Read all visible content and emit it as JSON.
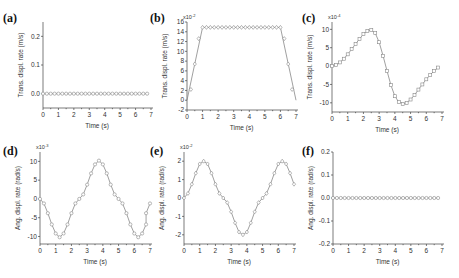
{
  "chart_data": [
    {
      "id": "a",
      "panel_label": "(a)",
      "type": "line",
      "marker": "circle",
      "xlabel": "Time (s)",
      "ylabel": "Trans. displ. rate (m/s)",
      "multiplier": "",
      "xlim": [
        0,
        7
      ],
      "ylim": [
        -0.05,
        0.25
      ],
      "xticks": [
        "0",
        "1",
        "2",
        "3",
        "4",
        "5",
        "6",
        "7"
      ],
      "yticks": [
        "0.0",
        "0.1",
        "0.2"
      ],
      "ytick_values": [
        0.0,
        0.1,
        0.2
      ],
      "x": [
        0,
        0.25,
        0.5,
        0.75,
        1,
        1.25,
        1.5,
        1.75,
        2,
        2.25,
        2.5,
        2.75,
        3,
        3.25,
        3.5,
        3.75,
        4,
        4.25,
        4.5,
        4.75,
        5,
        5.25,
        5.5,
        5.75,
        6,
        6.25,
        6.5,
        6.75
      ],
      "y": [
        0,
        0,
        0,
        0,
        0,
        0,
        0,
        0,
        0,
        0,
        0,
        0,
        0,
        0,
        0,
        0,
        0,
        0,
        0,
        0,
        0,
        0,
        0,
        0,
        0,
        0,
        0,
        0
      ]
    },
    {
      "id": "b",
      "panel_label": "(b)",
      "type": "line",
      "marker": "diamond",
      "xlabel": "Time (s)",
      "ylabel": "Trans. displ. rate (m/s)",
      "multiplier": "x10",
      "multiplier_exp": "-2",
      "xlim": [
        0,
        7
      ],
      "ylim": [
        -2,
        16
      ],
      "xticks": [
        "0",
        "1",
        "2",
        "3",
        "4",
        "5",
        "6",
        "7"
      ],
      "yticks": [
        "-2",
        "0",
        "2",
        "4",
        "6",
        "8",
        "10",
        "12",
        "14",
        "16"
      ],
      "ytick_values": [
        -2,
        0,
        2,
        4,
        6,
        8,
        10,
        12,
        14,
        16
      ],
      "x": [
        0.25,
        0.5,
        0.75,
        1,
        1.25,
        1.5,
        1.75,
        2,
        2.25,
        2.5,
        2.75,
        3,
        3.25,
        3.5,
        3.75,
        4,
        4.25,
        4.5,
        4.75,
        5,
        5.25,
        5.5,
        5.75,
        6,
        6.25,
        6.5,
        6.75
      ],
      "y": [
        2.2,
        7.4,
        12.6,
        14.9,
        14.9,
        14.9,
        14.9,
        14.9,
        14.9,
        14.9,
        14.9,
        14.9,
        14.9,
        14.9,
        14.9,
        14.9,
        14.9,
        14.9,
        14.9,
        14.9,
        14.9,
        14.9,
        14.9,
        14.9,
        12.6,
        7.4,
        2.2
      ],
      "line_x": [
        0,
        1,
        6,
        7
      ],
      "line_y": [
        0,
        14.9,
        14.9,
        0
      ]
    },
    {
      "id": "c",
      "panel_label": "(c)",
      "type": "line",
      "marker": "square",
      "xlabel": "Time (s)",
      "ylabel": "Trans. displ. rate (m/s)",
      "multiplier": "x10",
      "multiplier_exp": "-4",
      "xlim": [
        0,
        7
      ],
      "ylim": [
        -12.5,
        12
      ],
      "xticks": [
        "0",
        "1",
        "2",
        "3",
        "4",
        "5",
        "6",
        "7"
      ],
      "yticks": [
        "-10",
        "-5",
        "0",
        "5",
        "10"
      ],
      "ytick_values": [
        -10,
        -5,
        0,
        5,
        10
      ],
      "x": [
        0,
        0.25,
        0.5,
        0.75,
        1,
        1.25,
        1.5,
        1.75,
        2,
        2.25,
        2.5,
        2.75,
        3,
        3.25,
        3.5,
        3.75,
        4,
        4.25,
        4.5,
        4.75,
        5,
        5.25,
        5.5,
        5.75,
        6,
        6.25,
        6.5,
        6.75
      ],
      "y": [
        0,
        0.3,
        1,
        2,
        3.2,
        4.6,
        6,
        7.4,
        8.7,
        9.5,
        9.8,
        9,
        6.5,
        2.8,
        -1.3,
        -5.2,
        -8.2,
        -9.8,
        -10.3,
        -10,
        -9.1,
        -7.9,
        -6.4,
        -5,
        -3.6,
        -2.4,
        -1.3,
        -0.4
      ]
    },
    {
      "id": "d",
      "panel_label": "(d)",
      "type": "line",
      "marker": "circle",
      "xlabel": "Time (s)",
      "ylabel": "Ang. displ. rate (rad/s)",
      "multiplier": "x10",
      "multiplier_exp": "-3",
      "xlim": [
        0,
        7
      ],
      "ylim": [
        -12,
        12.5
      ],
      "xticks": [
        "0",
        "1",
        "2",
        "3",
        "4",
        "5",
        "6",
        "7"
      ],
      "yticks": [
        "-10",
        "-5",
        "0",
        "5",
        "10"
      ],
      "ytick_values": [
        -10,
        -5,
        0,
        5,
        10
      ],
      "x": [
        0,
        0.25,
        0.5,
        0.75,
        1,
        1.25,
        1.5,
        1.75,
        2,
        2.25,
        2.5,
        2.75,
        3,
        3.25,
        3.5,
        3.75,
        4,
        4.25,
        4.5,
        4.75,
        5,
        5.25,
        5.5,
        5.75,
        6,
        6.25,
        6.5,
        6.75
      ],
      "y": [
        0,
        -1.2,
        -3.8,
        -6.8,
        -9.2,
        -10.2,
        -9.2,
        -6.8,
        -3.8,
        -1.2,
        0,
        1.2,
        3.8,
        6.8,
        9.2,
        10.2,
        9.2,
        6.8,
        3.8,
        1.2,
        0,
        -1.2,
        -3.8,
        -6.8,
        -9.2,
        -10.2,
        -9.2,
        -6.8
      ],
      "tail_x": [
        6.5,
        6.75,
        7
      ],
      "tail_y": [
        -6.8,
        -3.8,
        -1.2
      ]
    },
    {
      "id": "e",
      "panel_label": "(e)",
      "type": "line",
      "marker": "diamond",
      "xlabel": "Time (s)",
      "ylabel": "Ang. displ. rate (rad/s)",
      "multiplier": "x10",
      "multiplier_exp": "-2",
      "xlim": [
        0,
        7
      ],
      "ylim": [
        -2.5,
        2.5
      ],
      "xticks": [
        "0",
        "1",
        "2",
        "3",
        "4",
        "5",
        "6",
        "7"
      ],
      "yticks": [
        "-2",
        "-1",
        "0",
        "1",
        "2"
      ],
      "ytick_values": [
        -2,
        -1,
        0,
        1,
        2
      ],
      "x": [
        0,
        0.25,
        0.5,
        0.75,
        1,
        1.25,
        1.5,
        1.75,
        2,
        2.25,
        2.5,
        2.75,
        3,
        3.25,
        3.5,
        3.75,
        4,
        4.25,
        4.5,
        4.75,
        5,
        5.25,
        5.5,
        5.75,
        6,
        6.25,
        6.5,
        6.75,
        7
      ],
      "y": [
        0,
        0.25,
        0.75,
        1.35,
        1.85,
        2.0,
        1.85,
        1.35,
        0.75,
        0.25,
        0,
        -0.25,
        -0.75,
        -1.35,
        -1.85,
        -2.0,
        -1.85,
        -1.35,
        -0.75,
        -0.25,
        0,
        0.25,
        0.75,
        1.35,
        1.85,
        2.0,
        1.85,
        1.35,
        0.75,
        0.1
      ]
    },
    {
      "id": "f",
      "panel_label": "(f)",
      "type": "line",
      "marker": "circle",
      "xlabel": "Time (s)",
      "ylabel": "Ang. displ. rate (rad/s)",
      "multiplier": "",
      "xlim": [
        0,
        7
      ],
      "ylim": [
        -0.2,
        0.2
      ],
      "xticks": [
        "0",
        "1",
        "2",
        "3",
        "4",
        "5",
        "6",
        "7"
      ],
      "yticks": [
        "-0.2",
        "-0.1",
        "0.0",
        "0.1",
        "0.2"
      ],
      "ytick_values": [
        -0.2,
        -0.1,
        0.0,
        0.1,
        0.2
      ],
      "x": [
        0,
        0.25,
        0.5,
        0.75,
        1,
        1.25,
        1.5,
        1.75,
        2,
        2.25,
        2.5,
        2.75,
        3,
        3.25,
        3.5,
        3.75,
        4,
        4.25,
        4.5,
        4.75,
        5,
        5.25,
        5.5,
        5.75,
        6,
        6.25,
        6.5,
        6.75
      ],
      "y": [
        0,
        0,
        0,
        0,
        0,
        0,
        0,
        0,
        0,
        0,
        0,
        0,
        0,
        0,
        0,
        0,
        0,
        0,
        0,
        0,
        0,
        0,
        0,
        0,
        0,
        0,
        0,
        0
      ]
    }
  ],
  "layout": {
    "panels": {
      "a": {
        "x0": 43,
        "x1": 151,
        "yTop": 22,
        "yBot": 108,
        "labelX": 3,
        "labelY": 22
      },
      "b": {
        "x0": 187,
        "x1": 296,
        "yTop": 22,
        "yBot": 110,
        "labelX": 150,
        "labelY": 22
      },
      "c": {
        "x0": 332,
        "x1": 442,
        "yTop": 22,
        "yBot": 112,
        "labelX": 302,
        "labelY": 22
      },
      "d": {
        "x0": 40,
        "x1": 150,
        "yTop": 152,
        "yBot": 244,
        "labelX": 3,
        "labelY": 155
      },
      "e": {
        "x0": 184,
        "x1": 294,
        "yTop": 152,
        "yBot": 244,
        "labelX": 150,
        "labelY": 155
      },
      "f": {
        "x0": 333,
        "x1": 442,
        "yTop": 152,
        "yBot": 244,
        "labelX": 302,
        "labelY": 155
      }
    }
  }
}
